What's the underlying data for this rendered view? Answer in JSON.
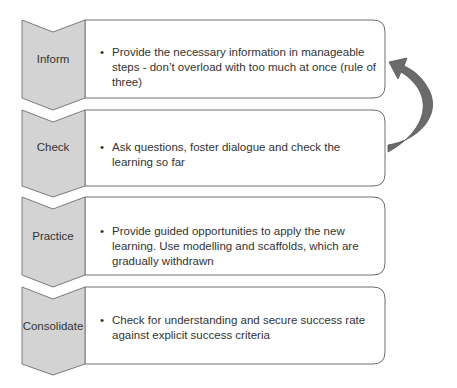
{
  "diagram": {
    "type": "chevron process with feedback arrow",
    "stages": [
      {
        "label": "Inform",
        "text": "Provide the necessary information in manageable steps - don’t overload with too much at once (rule of three)"
      },
      {
        "label": "Check",
        "text": "Ask questions, foster dialogue and check the learning so far"
      },
      {
        "label": "Practice",
        "text": "Provide guided opportunities to apply the new learning. Use modelling and scaffolds, which are gradually withdrawn"
      },
      {
        "label": "Consolidate",
        "text": "Check for understanding and secure success rate against explicit success criteria"
      }
    ],
    "feedback_arrow": {
      "from": "Check",
      "to": "Inform"
    },
    "colors": {
      "chevron_fill": "#d3d3d3",
      "chevron_stroke": "#7a7a7a",
      "box_stroke": "#6e6e6e",
      "arrow_fill": "#6b6b6b"
    }
  }
}
